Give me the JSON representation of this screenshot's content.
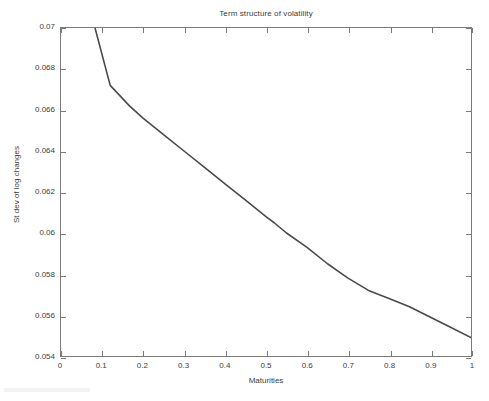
{
  "chart_data": {
    "type": "line",
    "title": "Term structure of volatility",
    "xlabel": "Maturities",
    "ylabel": "St dev of log changes",
    "xlim": [
      0,
      1
    ],
    "ylim": [
      0.054,
      0.07
    ],
    "grid": false,
    "legend": null,
    "line_color": "#4a4a4a",
    "line_width": 1.6,
    "xticks": [
      "0",
      "0.1",
      "0.2",
      "0.3",
      "0.4",
      "0.5",
      "0.6",
      "0.7",
      "0.8",
      "0.9",
      "1"
    ],
    "xtick_values": [
      0,
      0.1,
      0.2,
      0.3,
      0.4,
      0.5,
      0.6,
      0.7,
      0.8,
      0.9,
      1
    ],
    "yticks": [
      "0.054",
      "0.056",
      "0.058",
      "0.06",
      "0.062",
      "0.064",
      "0.066",
      "0.068",
      "0.07"
    ],
    "ytick_values": [
      0.054,
      0.056,
      0.058,
      0.06,
      0.062,
      0.064,
      0.066,
      0.068,
      0.07
    ],
    "series": [
      {
        "name": "Term structure of volatility",
        "x": [
          0.083,
          0.12,
          0.167,
          0.2,
          0.25,
          0.3,
          0.35,
          0.4,
          0.45,
          0.5,
          0.52,
          0.55,
          0.6,
          0.65,
          0.7,
          0.75,
          0.8,
          0.85,
          0.9,
          0.95,
          1.0
        ],
        "y": [
          0.07,
          0.0672,
          0.0662,
          0.0656,
          0.0648,
          0.064,
          0.0632,
          0.0624,
          0.0616,
          0.0608,
          0.0605,
          0.06,
          0.0593,
          0.0585,
          0.0578,
          0.0572,
          0.0568,
          0.0564,
          0.0559,
          0.0554,
          0.0549
        ]
      }
    ]
  }
}
